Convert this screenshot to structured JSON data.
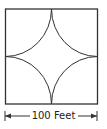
{
  "diagram": {
    "shape": "square with four quarter-circle arcs centered at each corner",
    "dimension_label": "100 Feet",
    "side_length_value": 100,
    "unit": "Feet",
    "stroke_color": "#333333",
    "background_color": "#ffffff"
  }
}
